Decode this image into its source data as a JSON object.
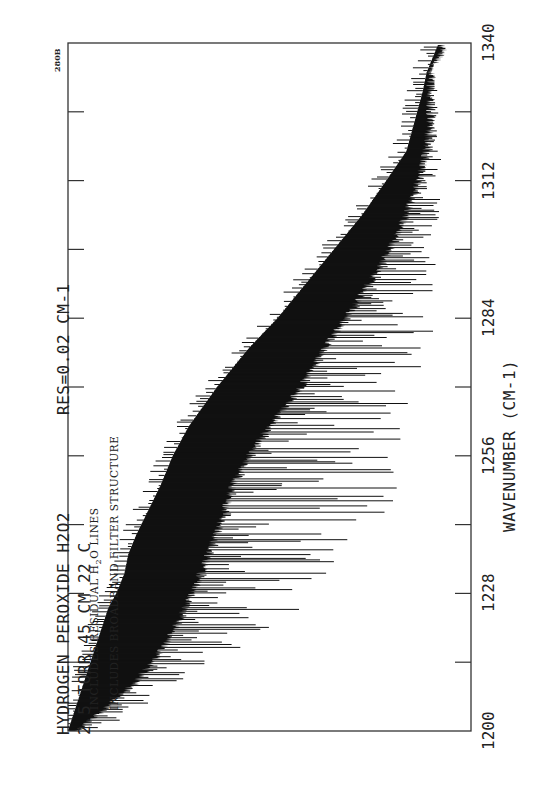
{
  "chart_data": {
    "type": "line",
    "title": "HYDROGEN PEROXIDE  H2O2",
    "subtitle": "2.5 TORR   45 CM   22 C",
    "resolution_label": "RES=0.02 CM-1",
    "plate_id": "280B",
    "notes": [
      "INCLUDES RESIDUAL H2O LINES",
      "INCLUDES BROADBAND FILTER STRUCTURE"
    ],
    "xlabel": "WAVENUMBER (CM-1)",
    "ylabel": "",
    "x_ticks": [
      1200,
      1228,
      1256,
      1284,
      1312,
      1340
    ],
    "x_minor_ticks": [
      1214,
      1242,
      1270,
      1298,
      1326
    ],
    "xlim": [
      1200,
      1340
    ],
    "orientation": "rotated 90deg counter-clockwise (wavenumber increases upward)",
    "grid": false,
    "legend": "none",
    "series": [
      {
        "name": "Transmittance spectrum (dense absorption lines)",
        "envelope_x": [
          1200,
          1205,
          1210,
          1215,
          1220,
          1225,
          1228,
          1232,
          1236,
          1240,
          1245,
          1250,
          1256,
          1262,
          1270,
          1278,
          1284,
          1290,
          1298,
          1305,
          1312,
          1318,
          1324,
          1330,
          1334,
          1336,
          1338,
          1340
        ],
        "envelope_top": [
          0.02,
          0.1,
          0.17,
          0.22,
          0.26,
          0.29,
          0.31,
          0.33,
          0.35,
          0.37,
          0.39,
          0.41,
          0.45,
          0.5,
          0.58,
          0.64,
          0.69,
          0.74,
          0.8,
          0.84,
          0.87,
          0.89,
          0.9,
          0.9,
          0.9,
          0.91,
          0.93,
          0.93
        ],
        "envelope_bottom": [
          0.0,
          0.02,
          0.04,
          0.06,
          0.08,
          0.1,
          0.12,
          0.14,
          0.15,
          0.17,
          0.2,
          0.23,
          0.26,
          0.3,
          0.37,
          0.45,
          0.52,
          0.58,
          0.66,
          0.73,
          0.79,
          0.84,
          0.86,
          0.88,
          0.89,
          0.9,
          0.91,
          0.92
        ],
        "deep_line_extent": [
          0.0,
          0.0,
          0.0,
          0.0,
          0.0,
          0.0,
          0.0,
          0.0,
          0.0,
          0.0,
          0.0,
          0.0,
          0.0,
          0.0,
          0.0,
          0.0,
          0.0,
          0.0,
          0.0,
          0.0,
          0.0,
          0.0,
          0.0,
          0.0,
          0.0,
          0.0,
          0.0,
          0.0
        ],
        "max_line_depth": [
          0.1,
          0.2,
          0.3,
          0.42,
          0.52,
          0.62,
          0.68,
          0.72,
          0.75,
          0.78,
          0.81,
          0.82,
          0.84,
          0.85,
          0.9,
          0.9,
          0.92,
          0.92,
          0.93,
          0.94,
          0.94,
          0.92,
          0.92,
          0.92,
          0.92,
          0.9,
          0.92,
          0.95
        ]
      }
    ]
  }
}
